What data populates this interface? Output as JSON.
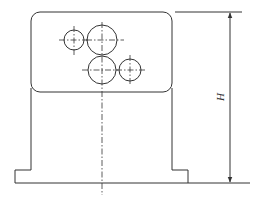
{
  "diagram": {
    "type": "technical-drawing",
    "dimension": {
      "label": "H",
      "orientation": "vertical"
    },
    "colors": {
      "line": "#333333",
      "background": "#ffffff"
    },
    "holes": [
      {
        "name": "small-hole-upper-left",
        "cx": 74,
        "cy": 40,
        "r": 10
      },
      {
        "name": "large-hole-upper",
        "cx": 102,
        "cy": 40,
        "r": 15
      },
      {
        "name": "large-hole-lower",
        "cx": 102,
        "cy": 70,
        "r": 14
      },
      {
        "name": "small-hole-lower-right",
        "cx": 130,
        "cy": 70,
        "r": 11
      }
    ]
  }
}
